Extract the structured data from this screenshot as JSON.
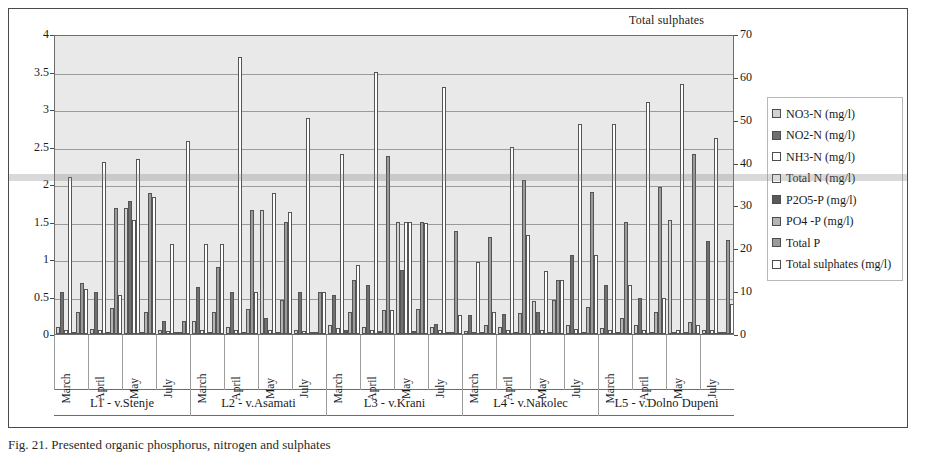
{
  "chart_data": {
    "type": "bar",
    "title": "Total sulphates",
    "xlabel": "",
    "ylabel": "",
    "ylim": [
      0,
      4
    ],
    "y2lim": [
      0,
      70
    ],
    "grid": true,
    "legend_position": "right",
    "y_ticks": [
      "0",
      "0.5",
      "1",
      "1.5",
      "2",
      "2.5",
      "3",
      "3.5",
      "4"
    ],
    "y2_ticks": [
      "0",
      "10",
      "20",
      "30",
      "40",
      "50",
      "60",
      "70"
    ],
    "months": [
      "March",
      "April",
      "May",
      "July"
    ],
    "locations": [
      "L1 - v.Stenje",
      "L2 - v.Asamati",
      "L3 - v.Krani",
      "L4 - v.Nakolec",
      "L5 - v.Dolno Dupeni"
    ],
    "categories": [
      "L1-March",
      "L1-April",
      "L1-May",
      "L1-July",
      "L2-March",
      "L2-April",
      "L2-May",
      "L2-July",
      "L3-March",
      "L3-April",
      "L3-May",
      "L3-July",
      "L4-March",
      "L4-April",
      "L4-May",
      "L4-July",
      "L5-March",
      "L5-April",
      "L5-May",
      "L5-July"
    ],
    "series": [
      {
        "name": "NO3-N (mg/l)",
        "color": "#d2d2d2",
        "axis": "left",
        "values": [
          0.1,
          0.07,
          1.68,
          0.05,
          0.18,
          0.1,
          1.65,
          0.06,
          0.12,
          0.09,
          1.5,
          0.1,
          0.04,
          0.1,
          0.44,
          0.12,
          0.08,
          0.12,
          1.52,
          0.05
        ]
      },
      {
        "name": "NO2-N (mg/l)",
        "color": "#6f6f6f",
        "axis": "left",
        "values": [
          0.56,
          0.56,
          1.78,
          0.18,
          0.63,
          0.56,
          0.21,
          0.56,
          0.52,
          0.66,
          0.86,
          0.14,
          0.25,
          0.27,
          0.3,
          1.05,
          0.65,
          0.48,
          0.02,
          1.24
        ]
      },
      {
        "name": "NH3-N (mg/l)",
        "color": "#fbfbfb",
        "axis": "left",
        "values": [
          0.06,
          0.06,
          1.52,
          0.04,
          0.05,
          0.06,
          0.06,
          0.04,
          0.08,
          0.05,
          1.5,
          0.05,
          0.03,
          0.06,
          0.06,
          0.07,
          0.05,
          0.06,
          0.06,
          0.05
        ]
      },
      {
        "name": "Total N (mg/l)",
        "color": "#ffffff",
        "axis": "left",
        "values": [
          2.1,
          2.3,
          2.33,
          1.2,
          1.2,
          3.7,
          1.88,
          2.88,
          2.4,
          3.5,
          1.5,
          3.3,
          0.96,
          2.5,
          0.84,
          2.8,
          2.8,
          3.1,
          3.34,
          2.62
        ]
      },
      {
        "name": "P2O5-P (mg/l)",
        "color": "#5a5a5a",
        "axis": "left",
        "values": [
          0.03,
          0.03,
          0.03,
          0.02,
          0.02,
          0.03,
          0.03,
          0.03,
          0.05,
          0.04,
          0.04,
          0.03,
          0.02,
          0.02,
          0.02,
          0.03,
          0.03,
          0.03,
          0.03,
          0.02
        ]
      },
      {
        "name": "PO4 -P (mg/l)",
        "color": "#b4b4b4",
        "axis": "left",
        "values": [
          0.3,
          0.35,
          0.3,
          0.03,
          0.3,
          0.34,
          0.45,
          0.03,
          0.3,
          0.32,
          0.33,
          0.03,
          0.12,
          0.28,
          0.45,
          0.36,
          0.22,
          0.3,
          0.16,
          0.02
        ]
      },
      {
        "name": "Total P",
        "color": "#9a9a9a",
        "axis": "left",
        "values": [
          0.68,
          1.68,
          1.88,
          0.18,
          0.9,
          1.65,
          1.5,
          0.56,
          0.72,
          2.38,
          1.5,
          1.38,
          1.3,
          2.06,
          0.72,
          1.9,
          1.5,
          1.96,
          2.4,
          1.25
        ]
      },
      {
        "name": "Total sulphates (mg/l)",
        "color": "#ffffff",
        "axis": "right",
        "values": [
          10.5,
          9.2,
          32.0,
          45.0,
          21.0,
          9.8,
          28.5,
          9.8,
          16.0,
          5.5,
          26.0,
          4.5,
          5.2,
          23.0,
          12.5,
          18.5,
          11.5,
          8.5,
          2.0,
          7.0
        ]
      }
    ]
  },
  "legend": {
    "items": [
      {
        "label": "NO3-N (mg/l)",
        "swatch": "#d2d2d2"
      },
      {
        "label": "NO2-N (mg/l)",
        "swatch": "#6f6f6f"
      },
      {
        "label": "NH3-N (mg/l)",
        "swatch": "#fdfdfd"
      },
      {
        "label": "Total N (mg/l)",
        "swatch": "#ffffff"
      },
      {
        "label": "P2O5-P (mg/l)",
        "swatch": "#5a5a5a"
      },
      {
        "label": "PO4 -P (mg/l)",
        "swatch": "#b4b4b4"
      },
      {
        "label": "Total P",
        "swatch": "#9a9a9a"
      },
      {
        "label": "Total sulphates (mg/l)",
        "swatch": "#ffffff"
      }
    ]
  },
  "caption": "Fig. 21. Presented organic phosphorus, nitrogen and sulphates"
}
